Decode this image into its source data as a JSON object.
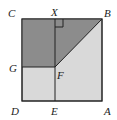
{
  "diagram": {
    "type": "geometry-square",
    "colors": {
      "dark_fill": "#8c8c8c",
      "light_fill": "#d9d9d9",
      "stroke": "#222222",
      "background": "#ffffff"
    },
    "points": {
      "C": {
        "label": "C",
        "x": 22,
        "y": 19
      },
      "X": {
        "label": "X",
        "x": 55,
        "y": 19
      },
      "B": {
        "label": "B",
        "x": 102,
        "y": 19
      },
      "G": {
        "label": "G",
        "x": 22,
        "y": 67
      },
      "F": {
        "label": "F",
        "x": 55,
        "y": 67
      },
      "D": {
        "label": "D",
        "x": 22,
        "y": 101
      },
      "E": {
        "label": "E",
        "x": 55,
        "y": 101
      },
      "A": {
        "label": "A",
        "x": 102,
        "y": 101
      }
    },
    "shaded_regions": [
      "rectangle CXFG",
      "triangle XBF"
    ],
    "segments": [
      "XE",
      "GF",
      "FB"
    ],
    "right_angle_at": "X"
  }
}
